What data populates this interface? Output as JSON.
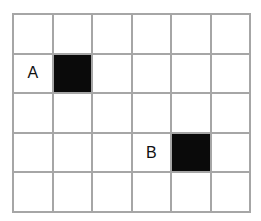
{
  "grid": {
    "columns": 6,
    "rows": 5,
    "line_color": "#a6a6a6",
    "fill_color": "#0a0a0a",
    "cells": [
      [
        "",
        "",
        "",
        "",
        "",
        ""
      ],
      [
        "A",
        "#",
        "",
        "",
        "",
        ""
      ],
      [
        "",
        "",
        "",
        "",
        "",
        ""
      ],
      [
        "",
        "",
        "",
        "B",
        "#",
        ""
      ],
      [
        "",
        "",
        "",
        "",
        "",
        ""
      ]
    ],
    "labels": [
      {
        "text": "A",
        "row": 1,
        "col": 0,
        "marks_filled_cell": {
          "row": 1,
          "col": 1
        }
      },
      {
        "text": "B",
        "row": 3,
        "col": 3,
        "marks_filled_cell": {
          "row": 3,
          "col": 4
        }
      }
    ]
  }
}
